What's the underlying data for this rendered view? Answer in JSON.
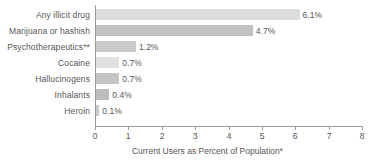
{
  "chart_data": {
    "type": "bar",
    "orientation": "horizontal",
    "title": "",
    "subtitle": "",
    "xlabel": "Current Users as Percent of Population*",
    "ylabel": "",
    "xlim": [
      0,
      8
    ],
    "xticks": [
      "0",
      "1",
      "2",
      "3",
      "4",
      "5",
      "6",
      "7",
      "8"
    ],
    "xtick_values": [
      0,
      1,
      2,
      3,
      4,
      5,
      6,
      7,
      8
    ],
    "grid": false,
    "legend": "none",
    "categories": [
      "Any illicit drug",
      "Marijuana or hashish",
      "Psychotherapeutics**",
      "Cocaine",
      "Hallucinogens",
      "Inhalants",
      "Heroin"
    ],
    "values": [
      6.1,
      4.7,
      1.2,
      0.7,
      0.7,
      0.4,
      0.1
    ],
    "value_labels": [
      "6.1%",
      "4.7%",
      "1.2%",
      "0.7%",
      "0.7%",
      "0.4%",
      "0.1%"
    ],
    "bar_colors": [
      "#dcdcdc",
      "#c2c2c2",
      "#c9c9c9",
      "#e0e0e0",
      "#c4c4c4",
      "#bdbdbd",
      "#c9c9c9"
    ],
    "axis_color": "#9a9a9a",
    "text_color": "#555555",
    "background": "#ffffff"
  },
  "bars": [
    {
      "label": "Any illicit drug",
      "value": 6.1,
      "value_label": "6.1%",
      "color": "#dcdcdc"
    },
    {
      "label": "Marijuana or hashish",
      "value": 4.7,
      "value_label": "4.7%",
      "color": "#c2c2c2"
    },
    {
      "label": "Psychotherapeutics**",
      "value": 1.2,
      "value_label": "1.2%",
      "color": "#c9c9c9"
    },
    {
      "label": "Cocaine",
      "value": 0.7,
      "value_label": "0.7%",
      "color": "#e0e0e0"
    },
    {
      "label": "Hallucinogens",
      "value": 0.7,
      "value_label": "0.7%",
      "color": "#c4c4c4"
    },
    {
      "label": "Inhalants",
      "value": 0.4,
      "value_label": "0.4%",
      "color": "#bdbdbd"
    },
    {
      "label": "Heroin",
      "value": 0.1,
      "value_label": "0.1%",
      "color": "#c9c9c9"
    }
  ],
  "axis": {
    "x_title": "Current Users as Percent of Population*",
    "ticks": [
      "0",
      "1",
      "2",
      "3",
      "4",
      "5",
      "6",
      "7",
      "8"
    ]
  }
}
